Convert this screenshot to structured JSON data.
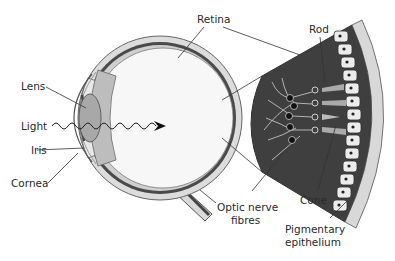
{
  "diagram": {
    "type": "anatomical",
    "labels": {
      "lens": "Lens",
      "light": "Light",
      "iris": "Iris",
      "cornea": "Cornea",
      "retina": "Retina",
      "rod": "Rod",
      "cone": "Cone",
      "optic_nerve_line1": "Optic nerve",
      "optic_nerve_line2": "fibres",
      "pigmentary_line1": "Pigmentary",
      "pigmentary_line2": "epithelium"
    },
    "colors": {
      "background": "#ffffff",
      "eye_outer": "#d9d9d9",
      "eye_dark_layer": "#555555",
      "retina_dark": "#3f3f3f",
      "epithelium_cell": "#e6e6e6",
      "outline": "#333333",
      "label_text": "#2a2a2a"
    }
  }
}
